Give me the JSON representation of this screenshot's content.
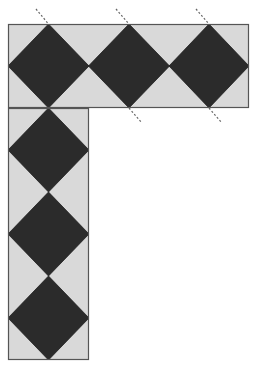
{
  "diagram": {
    "title": "",
    "colors": {
      "background": "#ffffff",
      "tile_light": "#d9d9d9",
      "tile_dark": "#2b2b2b",
      "border": "#555555",
      "dashed_line": "#666666"
    },
    "top_bar": {
      "x": 8,
      "y": 24,
      "width": 241,
      "height": 84
    },
    "vertical_bar": {
      "x": 8,
      "y": 108,
      "width": 81,
      "height": 252
    },
    "diamonds": [
      {
        "id": "top-1",
        "cx": 48.5,
        "cy": 66,
        "rx": 40.5,
        "ry": 42
      },
      {
        "id": "top-2",
        "cx": 129,
        "cy": 66,
        "rx": 40.5,
        "ry": 42
      },
      {
        "id": "top-3",
        "cx": 209,
        "cy": 66,
        "rx": 40,
        "ry": 42
      },
      {
        "id": "col-1",
        "cx": 48.5,
        "cy": 150,
        "rx": 40.5,
        "ry": 42
      },
      {
        "id": "col-2",
        "cx": 48.5,
        "cy": 234,
        "rx": 40.5,
        "ry": 42
      },
      {
        "id": "col-3",
        "cx": 48.5,
        "cy": 318,
        "rx": 40.5,
        "ry": 42
      }
    ],
    "dashed_lines": [
      {
        "x1": 36,
        "y1": 9,
        "x2": 48.5,
        "y2": 24
      },
      {
        "x1": 116,
        "y1": 9,
        "x2": 129,
        "y2": 24
      },
      {
        "x1": 196,
        "y1": 9,
        "x2": 209,
        "y2": 24
      },
      {
        "x1": 129,
        "y1": 108,
        "x2": 142,
        "y2": 123
      },
      {
        "x1": 209,
        "y1": 108,
        "x2": 222,
        "y2": 123
      }
    ]
  }
}
